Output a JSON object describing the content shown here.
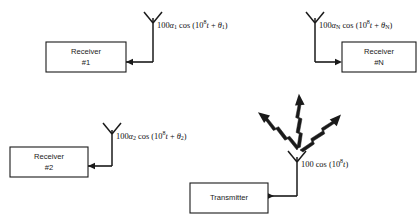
{
  "diagram": {
    "background_color": "#ffffff",
    "line_color": "#1a1a1a"
  },
  "transmitter": {
    "label": "Transmitter",
    "signal": {
      "amplitude": "100",
      "function": "cos",
      "open_paren": "(",
      "base": "10",
      "exponent": "8",
      "time_var": "t",
      "close_paren": ")",
      "full_text": "100 cos (10⁸t)"
    },
    "antenna_name": "antenna-transmit",
    "radiation_arrows": 3
  },
  "receivers": [
    {
      "label_line1": "Receiver",
      "label_line2": "#1",
      "signal": {
        "amplitude": "100",
        "gain_symbol": "α",
        "gain_subscript": "1",
        "function": "cos",
        "open_paren": "(",
        "base": "10",
        "exponent": "8",
        "time_var": "t",
        "plus": "+",
        "phase_symbol": "θ",
        "phase_subscript": "1",
        "close_paren": ")",
        "full_text": "100α₁ cos (10⁸t + θ₁)"
      },
      "antenna_name": "antenna-receive-1",
      "feed_direction": "left"
    },
    {
      "label_line1": "Receiver",
      "label_line2": "#N",
      "signal": {
        "amplitude": "100",
        "gain_symbol": "α",
        "gain_subscript": "N",
        "function": "cos",
        "open_paren": "(",
        "base": "10",
        "exponent": "8",
        "time_var": "t",
        "plus": "+",
        "phase_symbol": "θ",
        "phase_subscript": "N",
        "close_paren": ")",
        "full_text": "100α_N cos (10⁸t + θ_N)"
      },
      "antenna_name": "antenna-receive-n",
      "feed_direction": "right"
    },
    {
      "label_line1": "Receiver",
      "label_line2": "#2",
      "signal": {
        "amplitude": "100",
        "gain_symbol": "α",
        "gain_subscript": "2",
        "function": "cos",
        "open_paren": "(",
        "base": "10",
        "exponent": "8",
        "time_var": "t",
        "plus": "+",
        "phase_symbol": "θ",
        "phase_subscript": "2",
        "close_paren": ")",
        "full_text": "100α₂ cos (10⁸t + θ₂)"
      },
      "antenna_name": "antenna-receive-2",
      "feed_direction": "left"
    }
  ]
}
